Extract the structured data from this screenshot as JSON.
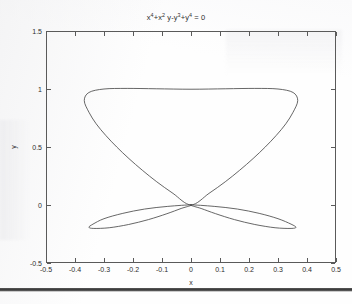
{
  "figure": {
    "title_plain": "x^4+x^2 y-y^3+y^4 = 0",
    "xaxis_title": "x",
    "yaxis_title": "y",
    "axis_color": "#5a5a5a",
    "curve_color": "#4b4b4b",
    "background": "#fefefe"
  },
  "chart_data": {
    "type": "line",
    "equation": "x^4 + x^2*y - y^3 + y^4 = 0",
    "xlabel": "x",
    "ylabel": "y",
    "xlim": [
      -0.5,
      0.5
    ],
    "ylim": [
      -0.5,
      1.5
    ],
    "xticks": [
      -0.5,
      -0.4,
      -0.3,
      -0.2,
      -0.1,
      0,
      0.1,
      0.2,
      0.3,
      0.4,
      0.5
    ],
    "xticklabels": [
      "-0.5",
      "-0.4",
      "-0.3",
      "-0.2",
      "-0.1",
      "0",
      "0.1",
      "0.2",
      "0.3",
      "0.4",
      "0.5"
    ],
    "yticks": [
      -0.5,
      0,
      0.5,
      1,
      1.5
    ],
    "yticklabels": [
      "-0.5",
      "0",
      "0.5",
      "1",
      "1.5"
    ],
    "grid": false,
    "legend": null,
    "box": true,
    "ticks_all_sides": true,
    "annotations": [
      {
        "text": "self-intersection (node) at origin",
        "x": 0,
        "y": 0
      },
      {
        "text": "upper loop apex",
        "x": 0,
        "y": 1.0
      },
      {
        "text": "upper loop left extreme",
        "x": -0.355,
        "y": 0.68
      },
      {
        "text": "upper loop right extreme",
        "x": 0.37,
        "y": 0.66
      },
      {
        "text": "lower lobe left tip",
        "x": -0.345,
        "y": -0.18
      },
      {
        "text": "lower lobe right tip",
        "x": 0.36,
        "y": -0.18
      }
    ],
    "series": [
      {
        "name": "upper-loop",
        "closed": true,
        "points": [
          [
            0.0,
            0.0
          ],
          [
            0.062,
            0.1
          ],
          [
            0.118,
            0.2
          ],
          [
            0.168,
            0.3
          ],
          [
            0.214,
            0.4
          ],
          [
            0.256,
            0.5
          ],
          [
            0.294,
            0.6
          ],
          [
            0.327,
            0.7
          ],
          [
            0.352,
            0.8
          ],
          [
            0.368,
            0.9
          ],
          [
            0.352,
            0.97
          ],
          [
            0.3,
            1.0
          ],
          [
            0.22,
            1.005
          ],
          [
            0.12,
            1.002
          ],
          [
            0.0,
            0.998
          ],
          [
            -0.12,
            1.002
          ],
          [
            -0.22,
            1.005
          ],
          [
            -0.3,
            1.0
          ],
          [
            -0.352,
            0.97
          ],
          [
            -0.368,
            0.9
          ],
          [
            -0.352,
            0.8
          ],
          [
            -0.327,
            0.7
          ],
          [
            -0.294,
            0.6
          ],
          [
            -0.256,
            0.5
          ],
          [
            -0.214,
            0.4
          ],
          [
            -0.168,
            0.3
          ],
          [
            -0.118,
            0.2
          ],
          [
            -0.062,
            0.1
          ],
          [
            0.0,
            0.0
          ]
        ]
      },
      {
        "name": "lower-lobe-right",
        "closed": true,
        "points": [
          [
            0.0,
            0.0
          ],
          [
            0.08,
            -0.012
          ],
          [
            0.16,
            -0.035
          ],
          [
            0.235,
            -0.072
          ],
          [
            0.3,
            -0.118
          ],
          [
            0.345,
            -0.165
          ],
          [
            0.362,
            -0.192
          ],
          [
            0.345,
            -0.202
          ],
          [
            0.29,
            -0.196
          ],
          [
            0.22,
            -0.168
          ],
          [
            0.15,
            -0.126
          ],
          [
            0.085,
            -0.075
          ],
          [
            0.035,
            -0.03
          ],
          [
            0.0,
            0.0
          ]
        ]
      },
      {
        "name": "lower-lobe-left",
        "closed": true,
        "points": [
          [
            0.0,
            0.0
          ],
          [
            -0.08,
            -0.012
          ],
          [
            -0.16,
            -0.035
          ],
          [
            -0.235,
            -0.072
          ],
          [
            -0.3,
            -0.118
          ],
          [
            -0.338,
            -0.165
          ],
          [
            -0.352,
            -0.192
          ],
          [
            -0.335,
            -0.202
          ],
          [
            -0.282,
            -0.196
          ],
          [
            -0.215,
            -0.168
          ],
          [
            -0.147,
            -0.126
          ],
          [
            -0.083,
            -0.075
          ],
          [
            -0.034,
            -0.03
          ],
          [
            0.0,
            0.0
          ]
        ]
      }
    ]
  }
}
